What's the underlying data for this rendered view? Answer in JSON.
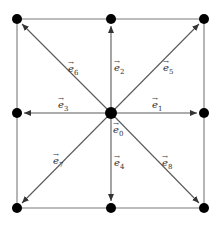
{
  "diagram": {
    "colors": {
      "node": "#000000",
      "edge": "#7a7a7a",
      "vector": "#5a5a5a",
      "label": "#333333"
    },
    "nodes": [
      {
        "id": "n6",
        "x": 17,
        "y": 19
      },
      {
        "id": "n2",
        "x": 111,
        "y": 19
      },
      {
        "id": "n5",
        "x": 204,
        "y": 19
      },
      {
        "id": "n3",
        "x": 17,
        "y": 113
      },
      {
        "id": "n0",
        "x": 111,
        "y": 113
      },
      {
        "id": "n1",
        "x": 204,
        "y": 113
      },
      {
        "id": "n7",
        "x": 17,
        "y": 208
      },
      {
        "id": "n4",
        "x": 111,
        "y": 208
      },
      {
        "id": "n8",
        "x": 204,
        "y": 208
      }
    ],
    "vectors": [
      {
        "name": "e1",
        "base": "e",
        "sub": "1",
        "lx": 152,
        "ly": 108
      },
      {
        "name": "e2",
        "base": "e",
        "sub": "2",
        "lx": 114,
        "ly": 71
      },
      {
        "name": "e3",
        "base": "e",
        "sub": "3",
        "lx": 58,
        "ly": 108
      },
      {
        "name": "e4",
        "base": "e",
        "sub": "4",
        "lx": 114,
        "ly": 166
      },
      {
        "name": "e5",
        "base": "e",
        "sub": "5",
        "lx": 163,
        "ly": 71
      },
      {
        "name": "e6",
        "base": "e",
        "sub": "6",
        "lx": 68,
        "ly": 72
      },
      {
        "name": "e7",
        "base": "e",
        "sub": "7",
        "lx": 53,
        "ly": 164
      },
      {
        "name": "e8",
        "base": "e",
        "sub": "8",
        "lx": 162,
        "ly": 166
      },
      {
        "name": "e0",
        "base": "e",
        "sub": "0",
        "lx": 113,
        "ly": 133
      }
    ]
  }
}
